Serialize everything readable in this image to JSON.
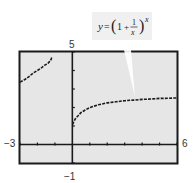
{
  "chart_data": {
    "type": "line",
    "title": "",
    "function_label": "y = (1 + 1/x)^x",
    "formula_parts": {
      "lhs": "y",
      "eq": "=",
      "one": "1",
      "plus": "+",
      "num": "1",
      "den": "x",
      "exp": "x"
    },
    "xlabel": "",
    "ylabel": "",
    "xlim": [
      -3,
      6
    ],
    "ylim": [
      -1,
      5
    ],
    "x_tick_step": 1,
    "y_tick_step": 1,
    "grid": false,
    "window_labels": {
      "xmin": "−3",
      "xmax": "6",
      "ymin": "−1",
      "ymax": "5"
    },
    "series": [
      {
        "name": "left branch (x < -1)",
        "x": [
          -3,
          -2.75,
          -2.5,
          -2.25,
          -2,
          -1.8,
          -1.6,
          -1.5,
          -1.4,
          -1.3,
          -1.25,
          -1.2,
          -1.18
        ],
        "y": [
          3.375,
          3.5,
          3.66,
          3.86,
          4.0,
          4.12,
          4.28,
          4.33,
          4.39,
          4.49,
          4.53,
          4.65,
          4.71
        ]
      },
      {
        "name": "right branch (x > 0)",
        "x": [
          0.02,
          0.05,
          0.1,
          0.2,
          0.3,
          0.5,
          0.75,
          1,
          1.5,
          2,
          2.5,
          3,
          3.5,
          4,
          4.5,
          5,
          5.5,
          6
        ],
        "y": [
          1.08,
          1.16,
          1.27,
          1.43,
          1.53,
          1.73,
          1.87,
          2.0,
          2.15,
          2.25,
          2.31,
          2.37,
          2.4,
          2.44,
          2.46,
          2.49,
          2.5,
          2.52
        ]
      }
    ]
  },
  "colors": {
    "screen_bg": "#e6e6e6",
    "frame": "#1a1a1a",
    "curve": "#1a1a1a",
    "callout_bg": "#f0f0f0",
    "pointer": "#ffffff"
  }
}
